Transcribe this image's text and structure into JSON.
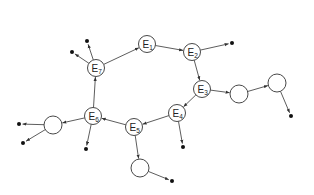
{
  "diagram": {
    "labeled_nodes": [
      {
        "id": "E1",
        "label": "E",
        "sub": "1",
        "x": 147,
        "y": 44
      },
      {
        "id": "E2",
        "label": "E",
        "sub": "2",
        "x": 192,
        "y": 52
      },
      {
        "id": "E3",
        "label": "E",
        "sub": "3",
        "x": 202,
        "y": 89
      },
      {
        "id": "E4",
        "label": "E",
        "sub": "4",
        "x": 177,
        "y": 113
      },
      {
        "id": "E5",
        "label": "E",
        "sub": "5",
        "x": 134,
        "y": 127
      },
      {
        "id": "E6",
        "label": "E",
        "sub": "6",
        "x": 93,
        "y": 116
      },
      {
        "id": "E7",
        "label": "E",
        "sub": "7",
        "x": 96,
        "y": 68
      }
    ],
    "empty_nodes": [
      {
        "id": "C1",
        "x": 239,
        "y": 94
      },
      {
        "id": "C2",
        "x": 277,
        "y": 83
      },
      {
        "id": "C3",
        "x": 140,
        "y": 168
      },
      {
        "id": "C4",
        "x": 53,
        "y": 125
      }
    ],
    "terminal_dots": [
      {
        "id": "D1",
        "x": 72,
        "y": 52
      },
      {
        "id": "D2",
        "x": 87,
        "y": 41
      },
      {
        "id": "D3",
        "x": 232,
        "y": 43
      },
      {
        "id": "D4",
        "x": 291,
        "y": 116
      },
      {
        "id": "D5",
        "x": 183,
        "y": 147
      },
      {
        "id": "D6",
        "x": 172,
        "y": 181
      },
      {
        "id": "D7",
        "x": 19,
        "y": 124
      },
      {
        "id": "D8",
        "x": 23,
        "y": 143
      },
      {
        "id": "D9",
        "x": 86,
        "y": 149
      }
    ],
    "edges": [
      [
        "E7",
        "E1"
      ],
      [
        "E7",
        "D1"
      ],
      [
        "E7",
        "D2"
      ],
      [
        "E1",
        "E2"
      ],
      [
        "E2",
        "D3"
      ],
      [
        "E2",
        "E3"
      ],
      [
        "E3",
        "C1"
      ],
      [
        "C1",
        "C2"
      ],
      [
        "C2",
        "D4"
      ],
      [
        "E3",
        "E4"
      ],
      [
        "E4",
        "D5"
      ],
      [
        "E4",
        "E5"
      ],
      [
        "E5",
        "C3"
      ],
      [
        "C3",
        "D6"
      ],
      [
        "E5",
        "E6"
      ],
      [
        "E6",
        "C4"
      ],
      [
        "C4",
        "D7"
      ],
      [
        "C4",
        "D8"
      ],
      [
        "E6",
        "D9"
      ],
      [
        "E6",
        "E7"
      ]
    ],
    "node_radius": 8.5,
    "empty_radius": 9,
    "dot_radius": 2
  }
}
